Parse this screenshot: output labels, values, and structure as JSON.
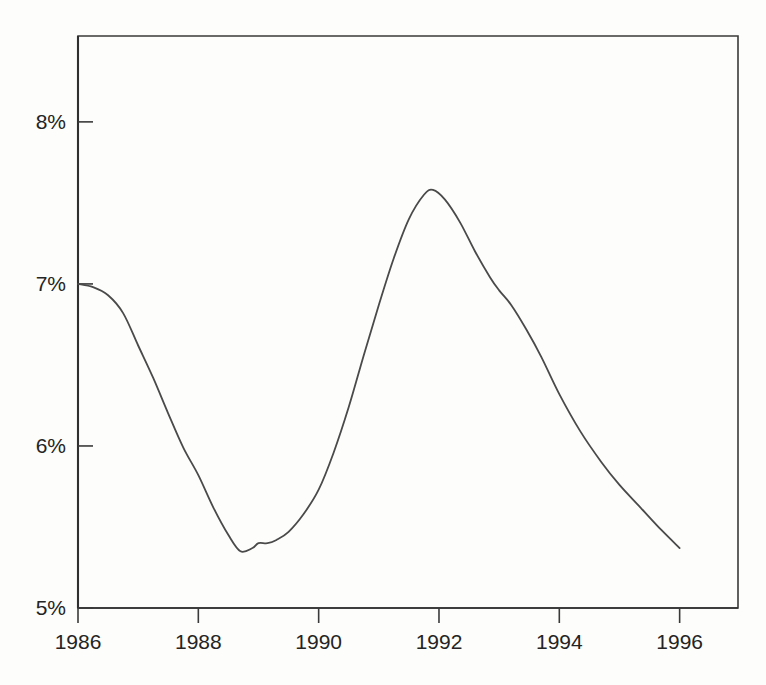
{
  "chart_data": {
    "type": "line",
    "title": "",
    "subtitle": "",
    "xlabel": "",
    "ylabel": "",
    "xlim": [
      1986,
      1996.97
    ],
    "ylim": [
      5,
      8.53
    ],
    "grid": false,
    "legend": null,
    "x_tick_labels": [
      "1986",
      "1988",
      "1990",
      "1992",
      "1994",
      "1996"
    ],
    "x_ticks": [
      1986,
      1988,
      1990,
      1992,
      1994,
      1996
    ],
    "y_tick_labels": [
      "5%",
      "6%",
      "7%",
      "8%"
    ],
    "y_ticks": [
      5,
      6,
      7,
      8
    ],
    "series": [
      {
        "name": "rate",
        "color": "#4a4a4a",
        "x": [
          1986.0,
          1986.25,
          1986.5,
          1986.75,
          1987.0,
          1987.25,
          1987.5,
          1987.75,
          1988.0,
          1988.25,
          1988.5,
          1988.7,
          1988.9,
          1989.0,
          1989.15,
          1989.3,
          1989.5,
          1989.75,
          1990.0,
          1990.25,
          1990.5,
          1990.75,
          1991.0,
          1991.25,
          1991.5,
          1991.75,
          1991.9,
          1992.1,
          1992.35,
          1992.6,
          1992.85,
          1993.0,
          1993.2,
          1993.45,
          1993.7,
          1994.0,
          1994.35,
          1994.7,
          1995.0,
          1995.35,
          1995.7,
          1996.0
        ],
        "y": [
          7.0,
          6.98,
          6.93,
          6.82,
          6.62,
          6.42,
          6.2,
          5.99,
          5.82,
          5.62,
          5.45,
          5.35,
          5.37,
          5.4,
          5.4,
          5.42,
          5.47,
          5.58,
          5.73,
          5.96,
          6.24,
          6.56,
          6.87,
          7.16,
          7.4,
          7.55,
          7.58,
          7.52,
          7.38,
          7.2,
          7.04,
          6.96,
          6.87,
          6.72,
          6.55,
          6.32,
          6.09,
          5.9,
          5.76,
          5.62,
          5.48,
          5.37
        ]
      }
    ]
  },
  "axes": {
    "y_tick_labels": [
      "8%",
      "7%",
      "6%",
      "5%"
    ],
    "x_tick_labels": [
      "1986",
      "1988",
      "1990",
      "1992",
      "1994",
      "1996"
    ]
  },
  "colors": {
    "line": "#4a4a4a",
    "axis": "#3a3a3a",
    "text": "#242424",
    "background": "#fdfdfb"
  }
}
